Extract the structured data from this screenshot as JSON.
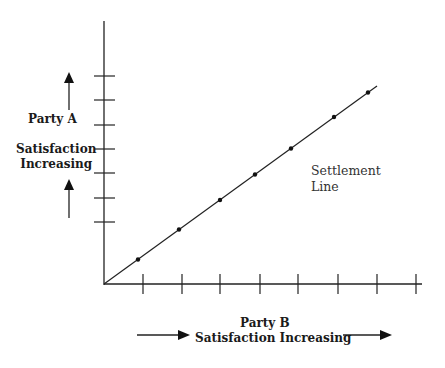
{
  "diagram": {
    "y_axis_label": {
      "line1": "Party A",
      "line2": "Satisfaction",
      "line3": "Increasing"
    },
    "x_axis_label": {
      "line1": "Party B",
      "line2": "Satisfaction Increasing"
    },
    "settlement_label": {
      "line1": "Settlement",
      "line2": "Line"
    },
    "y_ticks_count": 7,
    "x_ticks_count": 8,
    "settlement_points_count": 7,
    "line_color": "#222222"
  }
}
